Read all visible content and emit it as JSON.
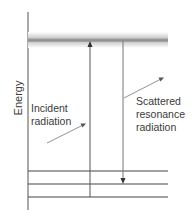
{
  "diagram": {
    "type": "energy-level-diagram",
    "axis_label": "Energy",
    "labels": {
      "incident": "Incident\nradiation",
      "scattered": "Scattered\nresonance\nradiation"
    },
    "levels": {
      "excited_band": 1,
      "lower_levels": 3
    },
    "transitions": [
      {
        "name": "incident",
        "direction": "up",
        "from_level": 3,
        "to_level": "excited"
      },
      {
        "name": "scattered",
        "direction": "down",
        "from_level": "excited",
        "to_level": 2
      }
    ],
    "colors": {
      "line": "#4a4a4a",
      "band": "#9a9a9a"
    }
  }
}
